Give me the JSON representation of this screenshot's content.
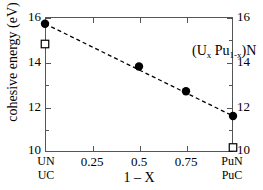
{
  "chart_data": {
    "type": "scatter",
    "title": "",
    "annotation": "(U",
    "annotation_parts": {
      "prefix": "(U",
      "sub1": "x",
      "mid": " Pu",
      "sub2": "1-x",
      "suffix": ")N"
    },
    "xlabel": "1 – X",
    "ylabel": "cohesive energy (eV)",
    "xlim": [
      0,
      1
    ],
    "ylim": [
      10,
      16
    ],
    "grid": false,
    "legend": null,
    "x_ticks": [
      0,
      0.25,
      0.5,
      0.75,
      1
    ],
    "x_ticklabels": [
      "",
      "0.25",
      "0.5",
      "0.75",
      ""
    ],
    "x_category_labels": [
      {
        "x": 0,
        "line1": "UN",
        "line2": "UC"
      },
      {
        "x": 1,
        "line1": "PuN",
        "line2": "PuC"
      }
    ],
    "y_ticks": [
      10,
      12,
      14,
      16
    ],
    "y_ticklabels_left": [
      "10",
      "12",
      "14",
      "16"
    ],
    "y_ticklabels_right": [
      "10",
      "12",
      "14",
      "16"
    ],
    "y_minor_ticks": [
      11,
      13,
      15
    ],
    "series": [
      {
        "name": "(U_x Pu_1-x)N nitride",
        "marker": "filled-circle",
        "color": "#000000",
        "x": [
          0,
          0.5,
          0.75,
          1
        ],
        "values": [
          15.7,
          13.8,
          12.7,
          11.6
        ]
      },
      {
        "name": "carbide endpoints",
        "marker": "open-square",
        "color": "#000000",
        "x": [
          0,
          1
        ],
        "values": [
          14.8,
          10.2
        ]
      }
    ],
    "fit_line": {
      "style": "dashed",
      "color": "#000000",
      "x": [
        0,
        1
      ],
      "values": [
        15.7,
        11.6
      ]
    }
  }
}
